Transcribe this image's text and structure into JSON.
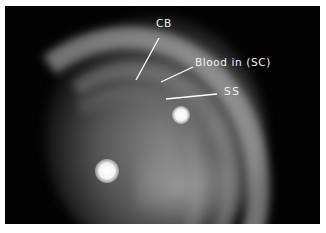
{
  "image": {
    "description": "Gonioscopic view of the anterior chamber angle with labeled structures",
    "background_color": "#030303",
    "border_color": "#ffffff"
  },
  "annotations": [
    {
      "id": "cb",
      "label": "CB",
      "meaning": "Ciliary body band"
    },
    {
      "id": "blood",
      "label": "Blood in (SC)",
      "meaning": "Blood in Schlemm's canal"
    },
    {
      "id": "ss",
      "label": "SS",
      "meaning": "Scleral spur"
    }
  ],
  "colors": {
    "label_text": "#f2f2f2",
    "leader_line": "#ffffff"
  }
}
